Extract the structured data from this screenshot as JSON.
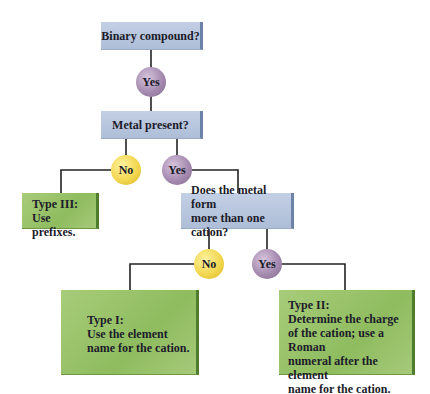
{
  "diagram": {
    "questions": {
      "q1": "Binary compound?",
      "q2": "Metal present?",
      "q3_line1": "Does the metal form",
      "q3_line2": "more than one cation?"
    },
    "decisions": {
      "q1_yes": "Yes",
      "q2_no": "No",
      "q2_yes": "Yes",
      "q3_no": "No",
      "q3_yes": "Yes"
    },
    "outcomes": {
      "type3": {
        "title": "Type III:",
        "lines": [
          "Use prefixes."
        ]
      },
      "type1": {
        "title": "Type I:",
        "lines": [
          "Use the element",
          "name for the cation."
        ]
      },
      "type2": {
        "title": "Type II:",
        "lines": [
          "Determine the charge",
          "of the cation; use a Roman",
          "numeral after the element",
          "name for the cation."
        ]
      }
    },
    "colors": {
      "question_box": "#b8c6de",
      "outcome_box": "#9cc46c",
      "yes_node": "#a68bb0",
      "no_node": "#f2d750",
      "connector": "#222222"
    }
  }
}
